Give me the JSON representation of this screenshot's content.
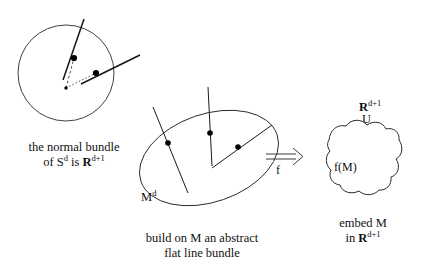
{
  "figure": {
    "background_color": "#ffffff",
    "stroke_color": "#1a1a1a",
    "dot_color": "#000000",
    "panels": [
      {
        "id": "normal-bundle-sphere",
        "shape": "circle"
      },
      {
        "id": "abstract-flat-line-bundle",
        "shape": "ellipse"
      },
      {
        "id": "embedded-manifold",
        "shape": "blob"
      }
    ]
  },
  "left_panel": {
    "caption_line1": "the normal bundle",
    "caption_line2_prefix": "of S",
    "caption_line2_sup1": "d",
    "caption_line2_mid": " is ",
    "caption_line2_bold": "R",
    "caption_line2_sup2": "d+1"
  },
  "center_panel": {
    "manifold_label_base": "M",
    "manifold_label_sup": "d",
    "caption_line1": "build on M an abstract",
    "caption_line2": "flat line bundle"
  },
  "arrow": {
    "glyph": "double-right-arrow",
    "label": "f"
  },
  "right_panel": {
    "ambient_label_bold": "R",
    "ambient_label_sup": "d+1",
    "neighbourhood_label": "U",
    "image_label": "f(M)",
    "caption_line1": "embed M",
    "caption_line2_prefix": "in ",
    "caption_line2_bold": "R",
    "caption_line2_sup": "d+1"
  }
}
